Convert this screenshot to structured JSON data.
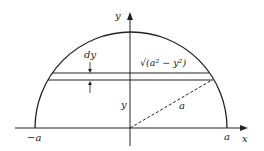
{
  "diagram": {
    "axes": {
      "x_label": "x",
      "y_label": "y",
      "x_left_tick": "−a",
      "x_right_tick": "a"
    },
    "labels": {
      "strip_thickness": "dy",
      "strip_half_width": "√(a² − y²)",
      "strip_height": "y",
      "radius": "a"
    },
    "colors": {
      "stroke": "#222222",
      "background": "#ffffff"
    }
  }
}
